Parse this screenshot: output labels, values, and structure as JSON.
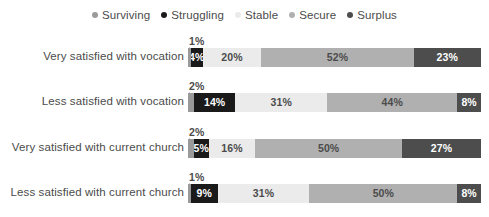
{
  "chart_data": {
    "type": "bar",
    "subtype": "stacked-horizontal-100pct",
    "title": "",
    "xlabel": "",
    "ylabel": "",
    "xlim": [
      0,
      100
    ],
    "grid": false,
    "legend_position": "top-center",
    "categories": [
      "Very satisfied with vocation",
      "Less satisfied with vocation",
      "Very satisfied with current church",
      "Less satisfied with current church"
    ],
    "series": [
      {
        "name": "Surviving",
        "color": "#9a9a9a",
        "values": [
          1,
          2,
          2,
          1
        ]
      },
      {
        "name": "Struggling",
        "color": "#1a1a1a",
        "values": [
          4,
          14,
          5,
          9
        ]
      },
      {
        "name": "Stable",
        "color": "#ebebeb",
        "values": [
          20,
          31,
          16,
          31
        ]
      },
      {
        "name": "Secure",
        "color": "#b0b0b0",
        "values": [
          52,
          44,
          50,
          50
        ]
      },
      {
        "name": "Surplus",
        "color": "#4d4d4d",
        "values": [
          23,
          8,
          27,
          8
        ]
      }
    ],
    "value_suffix": "%",
    "labels": [
      [
        "1%",
        "4%",
        "20%",
        "52%",
        "23%"
      ],
      [
        "2%",
        "14%",
        "31%",
        "44%",
        "8%"
      ],
      [
        "2%",
        "5%",
        "16%",
        "50%",
        "27%"
      ],
      [
        "1%",
        "9%",
        "31%",
        "50%",
        "8%"
      ]
    ],
    "callout_labels": [
      "1%",
      "2%",
      "2%",
      "1%"
    ]
  },
  "legend": {
    "items": [
      {
        "label": "Surviving",
        "color": "#9a9a9a"
      },
      {
        "label": "Struggling",
        "color": "#1a1a1a"
      },
      {
        "label": "Stable",
        "color": "#ebebeb"
      },
      {
        "label": "Secure",
        "color": "#b0b0b0"
      },
      {
        "label": "Surplus",
        "color": "#4d4d4d"
      }
    ]
  },
  "colors": {
    "background": "#ffffff",
    "text": "#4b4b4b",
    "label_on_dark": "#ffffff",
    "label_on_light": "#4b4b4b"
  }
}
